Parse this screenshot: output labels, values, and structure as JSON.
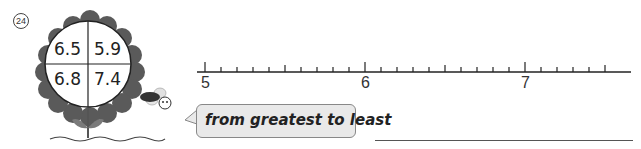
{
  "problem": {
    "number_label": "24",
    "instruction": "from greatest to least"
  },
  "flower": {
    "values": [
      "6.5",
      "5.9",
      "6.8",
      "7.4"
    ],
    "petal_color": "#5a5a5a",
    "stem_color": "#7a7a7a"
  },
  "number_line": {
    "labels": [
      "5",
      "6",
      "7"
    ],
    "min": 5,
    "max": 7.3,
    "step": 0.1
  },
  "answer": {
    "value": ""
  }
}
